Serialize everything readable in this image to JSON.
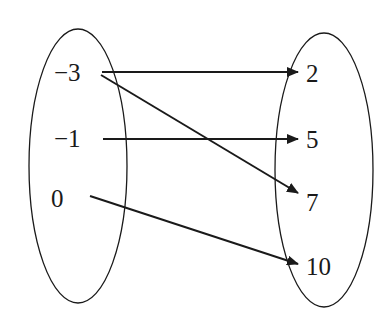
{
  "diagram": {
    "type": "mapping",
    "domain": {
      "label": "domain-set",
      "elements": [
        "−3",
        "−1",
        "0"
      ]
    },
    "range": {
      "label": "range-set",
      "elements": [
        "2",
        "5",
        "7",
        "10"
      ]
    },
    "mappings": [
      {
        "from": "−3",
        "to": "2"
      },
      {
        "from": "−3",
        "to": "7"
      },
      {
        "from": "−1",
        "to": "5"
      },
      {
        "from": "0",
        "to": "10"
      }
    ],
    "colors": {
      "stroke": "#1a1a1a",
      "background": "#ffffff"
    }
  }
}
